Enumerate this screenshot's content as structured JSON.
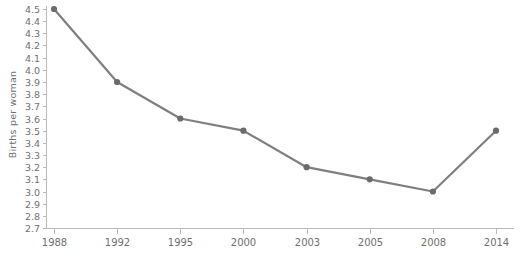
{
  "chart_data": {
    "type": "line",
    "title": "",
    "subtitle": "",
    "xlabel": "",
    "ylabel": "Births per woman",
    "categories": [
      "1988",
      "1992",
      "1995",
      "2000",
      "2003",
      "2005",
      "2008",
      "2014"
    ],
    "x_tick_labels": [
      "1988",
      "1992",
      "1995",
      "2000",
      "2003",
      "2005",
      "2008",
      "2014"
    ],
    "y_tick_labels": [
      "4.5",
      "4.4",
      "4.3",
      "4.2",
      "4.1",
      "4.0",
      "3.9",
      "3.8",
      "3.7",
      "3.6",
      "3.5",
      "3.4",
      "3.3",
      "3.2",
      "3.1",
      "3.0",
      "2.9",
      "2.8",
      "2.7"
    ],
    "values": [
      4.5,
      3.9,
      3.6,
      3.5,
      3.2,
      3.1,
      3.0,
      3.5
    ],
    "series": [
      {
        "name": "Births per woman",
        "values": [
          4.5,
          3.9,
          3.6,
          3.5,
          3.2,
          3.1,
          3.0,
          3.5
        ]
      }
    ],
    "ylim": [
      2.7,
      4.5
    ],
    "y_tick_step": 0.1,
    "grid": false,
    "legend": false,
    "legend_position": "none",
    "line_color": "#7f7f7f",
    "marker_color": "#6b6b6b",
    "marker_shape": "circle",
    "axis_color": "#b9b9b9",
    "text_color": "#6f6f6f",
    "background_color": "#ffffff",
    "annotations": []
  }
}
